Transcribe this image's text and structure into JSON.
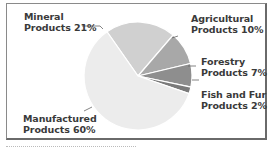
{
  "chart_data": {
    "type": "pie",
    "title": "",
    "slices": [
      {
        "label": "Manufactured Products",
        "value": 60,
        "color": "#ececec"
      },
      {
        "label": "Mineral Products",
        "value": 21,
        "color": "#d0d0d0"
      },
      {
        "label": "Agricultural Products",
        "value": 10,
        "color": "#a8a8a8"
      },
      {
        "label": "Forestry Products",
        "value": 7,
        "color": "#8e8e8e"
      },
      {
        "label": "Fish and Fur Products",
        "value": 2,
        "color": "#7a7a7a"
      }
    ],
    "labels": {
      "mineral": [
        "Mineral",
        "Products 21%"
      ],
      "agricultural": [
        "Agricultural",
        "Products 10%"
      ],
      "forestry": [
        "Forestry",
        "Products 7%"
      ],
      "fish": [
        "Fish and Fur",
        "Products 2%"
      ],
      "manufactured": [
        "Manufactured",
        "Products 60%"
      ]
    }
  }
}
